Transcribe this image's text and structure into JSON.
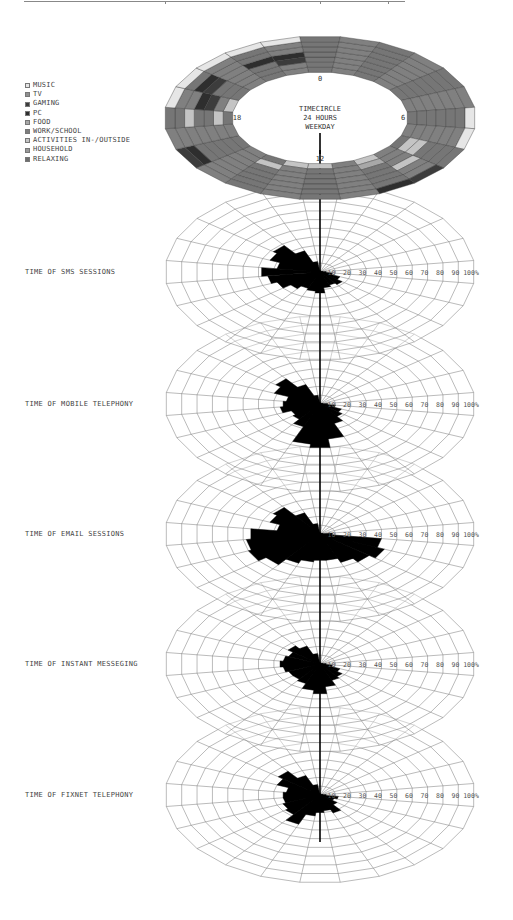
{
  "legend": {
    "items": [
      {
        "label": "MUSIC",
        "color": "#e6e6e6"
      },
      {
        "label": "TV",
        "color": "#8f8f8f"
      },
      {
        "label": "GAMING",
        "color": "#3c3c3c"
      },
      {
        "label": "PC",
        "color": "#2e2e2e"
      },
      {
        "label": "FOOD",
        "color": "#a8a8a8"
      },
      {
        "label": "WORK/SCHOOL",
        "color": "#7d7d7d"
      },
      {
        "label": "ACTIVITIES IN-/OUTSIDE",
        "color": "#c4c4c4"
      },
      {
        "label": "HOUSEHOLD",
        "color": "#9a9a9a"
      },
      {
        "label": "RELAXING",
        "color": "#6e6e6e"
      }
    ]
  },
  "timecircle": {
    "title_lines": [
      "TIMECIRCLE",
      "24 HOURS",
      "WEEKDAY"
    ],
    "hour_labels": {
      "top": "0",
      "right": "6",
      "bottom": "12",
      "left": "18"
    }
  },
  "charts": [
    {
      "label": "TIME OF SMS SESSIONS"
    },
    {
      "label": "TIME OF MOBILE TELEPHONY"
    },
    {
      "label": "TIME OF EMAIL SESSIONS"
    },
    {
      "label": "TIME OF INSTANT MESSEGING"
    },
    {
      "label": "TIME OF FIXNET TELEPHONY"
    }
  ],
  "axis_ticks": [
    "10",
    "20",
    "30",
    "40",
    "50",
    "60",
    "70",
    "80",
    "90",
    "100%"
  ],
  "chart_data": [
    {
      "type": "radar",
      "title": "TIMECIRCLE 24 HOURS WEEKDAY",
      "categories": [
        "0",
        "1",
        "2",
        "3",
        "4",
        "5",
        "6",
        "7",
        "8",
        "9",
        "10",
        "11",
        "12",
        "13",
        "14",
        "15",
        "16",
        "17",
        "18",
        "19",
        "20",
        "21",
        "22",
        "23"
      ],
      "description": "Stacked 24-hour activity ring; sectors shaded by activity category (see legend)",
      "legend": [
        "MUSIC",
        "TV",
        "GAMING",
        "PC",
        "FOOD",
        "WORK/SCHOOL",
        "ACTIVITIES IN-/OUTSIDE",
        "HOUSEHOLD",
        "RELAXING"
      ]
    },
    {
      "type": "radar",
      "title": "TIME OF SMS SESSIONS",
      "categories": [
        "0",
        "1",
        "2",
        "3",
        "4",
        "5",
        "6",
        "7",
        "8",
        "9",
        "10",
        "11",
        "12",
        "13",
        "14",
        "15",
        "16",
        "17",
        "18",
        "19",
        "20",
        "21",
        "22",
        "23"
      ],
      "values": [
        2,
        1,
        1,
        1,
        1,
        2,
        4,
        8,
        14,
        18,
        16,
        18,
        24,
        22,
        20,
        24,
        30,
        34,
        38,
        28,
        35,
        38,
        26,
        12
      ],
      "ylim": [
        0,
        100
      ],
      "ylabel": "%"
    },
    {
      "type": "radar",
      "title": "TIME OF MOBILE TELEPHONY",
      "categories": [
        "0",
        "1",
        "2",
        "3",
        "4",
        "5",
        "6",
        "7",
        "8",
        "9",
        "10",
        "11",
        "12",
        "13",
        "14",
        "15",
        "16",
        "17",
        "18",
        "19",
        "20",
        "21",
        "22",
        "23"
      ],
      "values": [
        2,
        1,
        1,
        1,
        1,
        2,
        5,
        10,
        15,
        18,
        24,
        40,
        50,
        46,
        28,
        22,
        20,
        26,
        24,
        22,
        32,
        36,
        24,
        10
      ],
      "ylim": [
        0,
        100
      ],
      "ylabel": "%"
    },
    {
      "type": "radar",
      "title": "TIME OF EMAIL SESSIONS",
      "categories": [
        "0",
        "1",
        "2",
        "3",
        "4",
        "5",
        "6",
        "7",
        "8",
        "9",
        "10",
        "11",
        "12",
        "13",
        "14",
        "15",
        "16",
        "17",
        "18",
        "19",
        "20",
        "21",
        "22",
        "23"
      ],
      "values": [
        2,
        1,
        1,
        1,
        1,
        2,
        8,
        40,
        45,
        40,
        35,
        30,
        30,
        32,
        36,
        44,
        50,
        48,
        45,
        28,
        35,
        38,
        26,
        12
      ],
      "ylim": [
        0,
        100
      ],
      "ylabel": "%"
    },
    {
      "type": "radar",
      "title": "TIME OF INSTANT MESSEGING",
      "categories": [
        "0",
        "1",
        "2",
        "3",
        "4",
        "5",
        "6",
        "7",
        "8",
        "9",
        "10",
        "11",
        "12",
        "13",
        "14",
        "15",
        "16",
        "17",
        "18",
        "19",
        "20",
        "21",
        "22",
        "23"
      ],
      "values": [
        2,
        1,
        1,
        1,
        1,
        2,
        4,
        8,
        14,
        18,
        20,
        26,
        34,
        30,
        24,
        22,
        22,
        24,
        26,
        24,
        22,
        26,
        22,
        12
      ],
      "ylim": [
        0,
        100
      ],
      "ylabel": "%"
    },
    {
      "type": "radar",
      "title": "TIME OF FIXNET TELEPHONY",
      "categories": [
        "0",
        "1",
        "2",
        "3",
        "4",
        "5",
        "6",
        "7",
        "8",
        "9",
        "10",
        "11",
        "12",
        "13",
        "14",
        "15",
        "16",
        "17",
        "18",
        "19",
        "20",
        "21",
        "22",
        "23"
      ],
      "values": [
        2,
        1,
        1,
        1,
        1,
        2,
        4,
        12,
        10,
        14,
        22,
        18,
        20,
        24,
        36,
        28,
        26,
        24,
        24,
        22,
        30,
        34,
        24,
        12
      ],
      "ylim": [
        0,
        100
      ],
      "ylabel": "%"
    }
  ]
}
